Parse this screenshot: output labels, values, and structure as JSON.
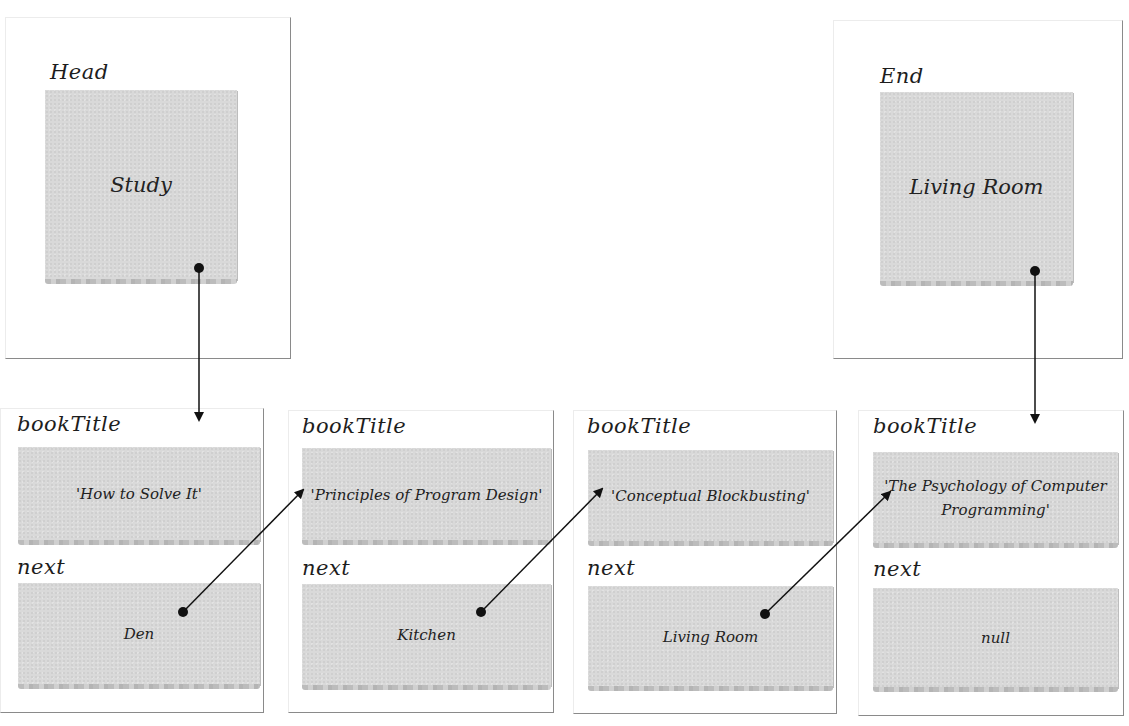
{
  "head": {
    "label": "Head",
    "value": "Study"
  },
  "end": {
    "label": "End",
    "value": "Living Room"
  },
  "nodes": [
    {
      "title_label": "bookTitle",
      "title": "'How to Solve It'",
      "next_label": "next",
      "next": "Den"
    },
    {
      "title_label": "bookTitle",
      "title": "'Principles of Program Design'",
      "next_label": "next",
      "next": "Kitchen"
    },
    {
      "title_label": "bookTitle",
      "title": "'Conceptual Blockbusting'",
      "next_label": "next",
      "next": "Living Room"
    },
    {
      "title_label": "bookTitle",
      "title": "'The Psychology of Computer Programming'",
      "next_label": "next",
      "next": "null"
    }
  ],
  "colors": {
    "note": "#d9d9d9",
    "frame": "#8a8a8a",
    "arrow": "#111111"
  }
}
